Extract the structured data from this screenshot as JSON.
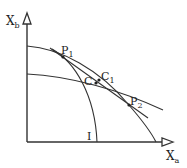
{
  "diagram": {
    "axes": {
      "y_label": "X",
      "y_sub": "b",
      "x_label": "X",
      "x_sub": "a"
    },
    "points": [
      {
        "name": "P",
        "sub": "1"
      },
      {
        "name": "P",
        "sub": "2"
      },
      {
        "name": "C",
        "sub": ""
      },
      {
        "name": "C",
        "sub": "1"
      }
    ],
    "curve_labels": {
      "indifference": "I"
    },
    "colors": {
      "stroke": "#333333",
      "background": "#ffffff"
    }
  }
}
